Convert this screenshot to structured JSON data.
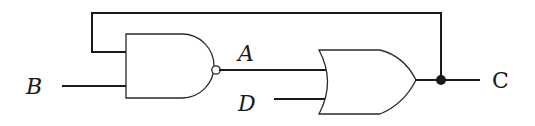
{
  "diagram": {
    "type": "logic-circuit",
    "labels": {
      "input_b": "B",
      "node_a": "A",
      "input_d": "D",
      "output_c": "C"
    },
    "gates": [
      {
        "id": "nand1",
        "type": "NAND",
        "inputs": [
          "C (feedback)",
          "B"
        ],
        "output": "A"
      },
      {
        "id": "or1",
        "type": "OR",
        "inputs": [
          "A",
          "D"
        ],
        "output": "C"
      }
    ],
    "connections": [
      {
        "from": "B",
        "to": "nand1.input2"
      },
      {
        "from": "C",
        "to": "nand1.input1",
        "note": "feedback loop over top"
      },
      {
        "from": "nand1.output",
        "to": "or1.input1",
        "label": "A"
      },
      {
        "from": "D",
        "to": "or1.input2"
      },
      {
        "from": "or1.output",
        "to": "C",
        "junction": true
      }
    ],
    "colors": {
      "line": "#1a1a1a",
      "background": "#ffffff"
    }
  }
}
